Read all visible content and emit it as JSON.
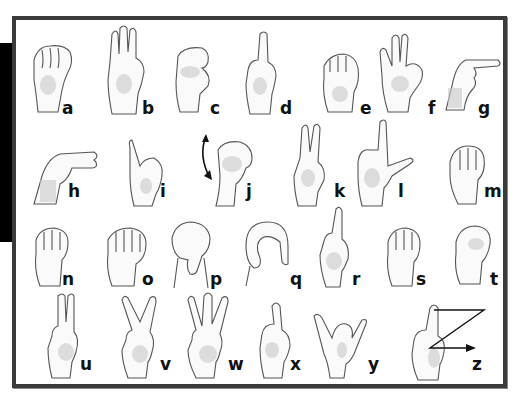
{
  "chart_title": "",
  "letters": [
    {
      "letter": "a",
      "row": 1
    },
    {
      "letter": "b",
      "row": 1
    },
    {
      "letter": "c",
      "row": 1
    },
    {
      "letter": "d",
      "row": 1
    },
    {
      "letter": "e",
      "row": 1
    },
    {
      "letter": "f",
      "row": 1
    },
    {
      "letter": "g",
      "row": 1
    },
    {
      "letter": "h",
      "row": 2
    },
    {
      "letter": "i",
      "row": 2
    },
    {
      "letter": "j",
      "row": 2
    },
    {
      "letter": "k",
      "row": 2
    },
    {
      "letter": "l",
      "row": 2
    },
    {
      "letter": "m",
      "row": 2
    },
    {
      "letter": "n",
      "row": 3
    },
    {
      "letter": "o",
      "row": 3
    },
    {
      "letter": "p",
      "row": 3
    },
    {
      "letter": "q",
      "row": 3
    },
    {
      "letter": "r",
      "row": 3
    },
    {
      "letter": "s",
      "row": 3
    },
    {
      "letter": "t",
      "row": 3
    },
    {
      "letter": "u",
      "row": 4
    },
    {
      "letter": "v",
      "row": 4
    },
    {
      "letter": "w",
      "row": 4
    },
    {
      "letter": "x",
      "row": 4
    },
    {
      "letter": "y",
      "row": 4
    },
    {
      "letter": "z",
      "row": 4
    }
  ],
  "colors": {
    "frame_border": "#3a3a3a",
    "side_bar": "#000000",
    "background": "#ffffff",
    "label": "#111111"
  },
  "motion_indicators": {
    "j": "curved-double-arrow",
    "z": "z-path-arrow"
  }
}
